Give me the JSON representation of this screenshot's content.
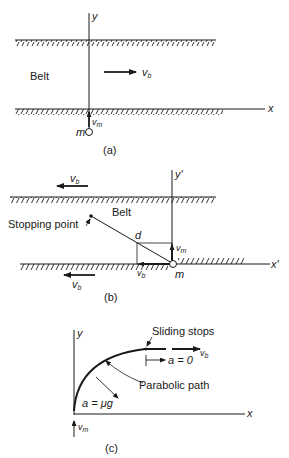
{
  "colors": {
    "ink": "#1a1a1a",
    "background": "#ffffff"
  },
  "panel_a": {
    "caption": "(a)",
    "axis_y_label": "y",
    "axis_x_label": "x",
    "belt_label": "Belt",
    "belt_velocity_label": "v",
    "belt_velocity_sub": "b",
    "mass_label": "m",
    "mass_velocity_label": "v",
    "mass_velocity_sub": "m"
  },
  "panel_b": {
    "caption": "(b)",
    "axis_y_label": "y'",
    "axis_x_label": "x'",
    "belt_label": "Belt",
    "stopping_point_label": "Stopping point",
    "distance_label": "d",
    "mass_label": "m",
    "mass_velocity_label": "v",
    "mass_velocity_sub": "m",
    "belt_velocity_component_label": "v",
    "belt_velocity_component_sub": "b",
    "top_belt_velocity_label": "v",
    "top_belt_velocity_sub": "b",
    "bottom_belt_velocity_label": "v",
    "bottom_belt_velocity_sub": "b"
  },
  "panel_c": {
    "caption": "(c)",
    "axis_y_label": "y",
    "axis_x_label": "x",
    "sliding_stops_label": "Sliding stops",
    "belt_velocity_label": "v",
    "belt_velocity_sub": "b",
    "zero_accel_label": "a = 0",
    "parabolic_path_label": "Parabolic path",
    "accel_label": "a = μg",
    "initial_velocity_label": "v",
    "initial_velocity_sub": "m"
  }
}
